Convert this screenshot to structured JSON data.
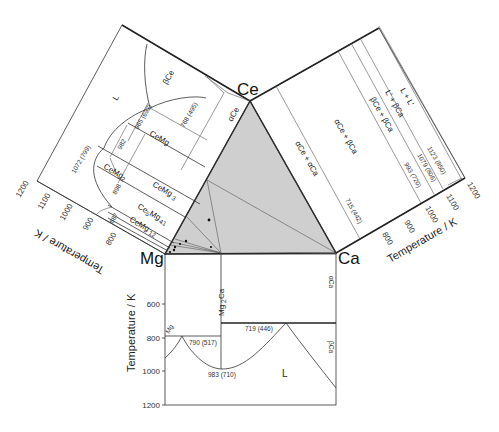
{
  "vertices": {
    "ce": "Ce",
    "mg": "Mg",
    "ca": "Ca"
  },
  "colors": {
    "triangle_fill": "#cfcfcf",
    "line": "#333333",
    "background": "#ffffff"
  },
  "ce_mg_panel": {
    "axis_label": "Temperature / K",
    "ticks": [
      "800",
      "900",
      "1000",
      "1100",
      "1200"
    ],
    "phases": [
      "L",
      "βCe",
      "αCe",
      "CeMg",
      "CeMg2",
      "CeMg3",
      "Ce5Mg41",
      "CeMg12"
    ],
    "phase_labels": {
      "L": "L",
      "beta_ce": "βCe",
      "alpha_ce": "αCe",
      "cemg": "CeMg",
      "cemg2_main": "CeMg",
      "cemg2_sub": "2",
      "cemg3_main": "CeMg",
      "cemg3_sub": "3",
      "ce5mg41_a": "Ce",
      "ce5mg41_b": "5",
      "ce5mg41_c": "Mg",
      "ce5mg41_d": "41",
      "cemg12_main": "CeMg",
      "cemg12_sub": "12"
    },
    "annotations": [
      "1072 (799)",
      "965 (692)",
      "768 (495)",
      "982",
      "898",
      "887"
    ]
  },
  "ce_ca_panel": {
    "axis_label": "Temperature / K",
    "ticks": [
      "800",
      "900",
      "1000",
      "1100",
      "1200"
    ],
    "phase_labels": {
      "l_l": "L + L'",
      "lp_bca": "L' + βCa",
      "bce_bca": "βCe + βCa",
      "ace_bca": "αCe + βCa",
      "ace_aca": "αCe + αCa"
    },
    "annotations": [
      "1123 (850)",
      "1079 (806)",
      "993 (720)",
      "715 (442)"
    ]
  },
  "mg_ca_panel": {
    "axis_label": "Temperature / K",
    "ticks": [
      "600",
      "800",
      "1000",
      "1200"
    ],
    "phase_labels": {
      "mg2ca_main": "Mg",
      "mg2ca_sub": "2",
      "mg2ca_tail": "Ca",
      "mg": "Mg",
      "alpha_ca": "αCa",
      "beta_ca": "βCa",
      "L": "L"
    },
    "annotations": [
      "790 (517)",
      "719 (446)",
      "983 (710)"
    ]
  }
}
